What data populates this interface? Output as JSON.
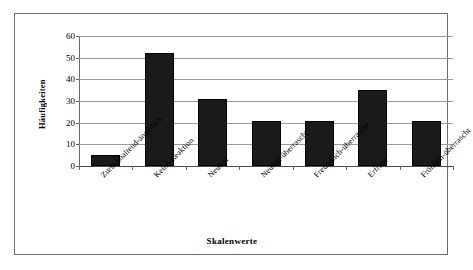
{
  "chart_data": {
    "type": "bar",
    "title": "",
    "xlabel": "Skalenwerte",
    "ylabel": "Häufigkeiten",
    "categories": [
      "Zurückhaltend-ängstlich",
      "Keine Reaktion",
      "Neutral",
      "Neutral-überrascht",
      "Freundlich-überrascht",
      "Erfreut",
      "Fröhlich-überrascht"
    ],
    "values": [
      5,
      52,
      31,
      21,
      21,
      35,
      21
    ],
    "ylim": [
      0,
      60
    ],
    "yticks": [
      0,
      10,
      20,
      30,
      40,
      50,
      60
    ],
    "ytick_labels": [
      "0",
      "10",
      "20",
      "30",
      "40",
      "50",
      "60"
    ],
    "grid": true,
    "legend": false,
    "bar_color": "#1a1a1a",
    "gridline_color": "#9a9a9a",
    "axis_color": "#6a6a6a",
    "frame_color": "#6d6d6d",
    "background": "#ffffff"
  }
}
